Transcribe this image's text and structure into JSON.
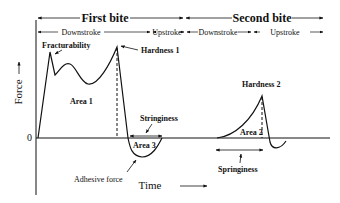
{
  "diagram": {
    "title_first_bite": "First bite",
    "title_second_bite": "Second bite",
    "strokes": [
      "Downstroke",
      "Upstroke",
      "Downstroke",
      "Upstroke"
    ],
    "y_axis_label": "Force",
    "x_axis_label": "Time",
    "zero_label": "0",
    "annotations": {
      "fracturability": "Fracturability",
      "hardness1": "Hardness 1",
      "hardness2": "Hardness 2",
      "area1": "Area 1",
      "area2": "Area 2",
      "area3": "Area 3",
      "stringiness": "Stringiness",
      "springiness": "Springiness",
      "adhesive_force": "Adhesive force"
    }
  },
  "colors": {
    "ink": "#111111",
    "background": "#ffffff"
  }
}
